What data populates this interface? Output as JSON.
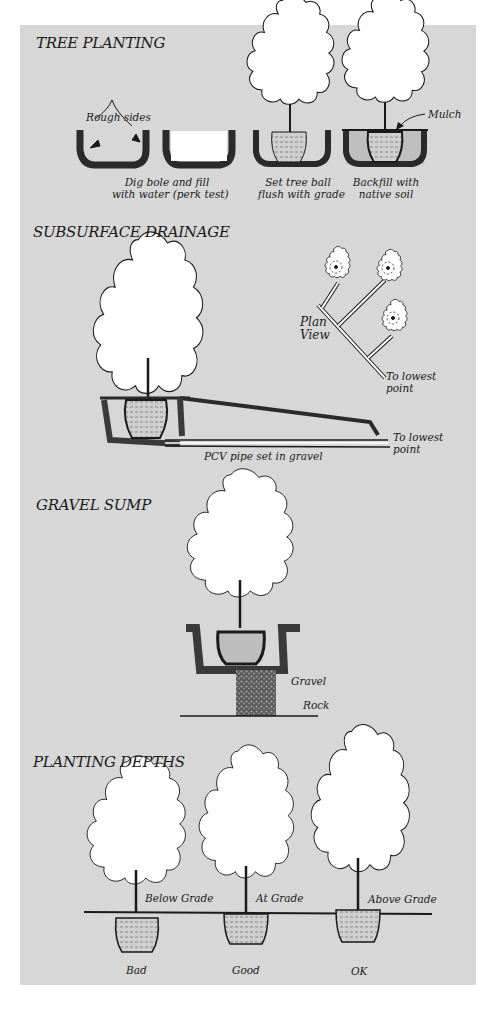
{
  "sections": {
    "tree_planting": {
      "title": "TREE PLANTING",
      "labels": {
        "rough_sides": "Rough sides",
        "mulch": "Mulch",
        "dig_line1": "Dig bole and fill",
        "dig_line2": "with water (perk test)",
        "set_line1": "Set tree ball",
        "set_line2": "flush with grade",
        "backfill_line1": "Backfill with",
        "backfill_line2": "native soil"
      }
    },
    "subsurface_drainage": {
      "title": "SUBSURFACE DRAINAGE",
      "labels": {
        "plan_line1": "Plan",
        "plan_line2": "View",
        "lowest_plan_line1": "To lowest",
        "lowest_plan_line2": "point",
        "lowest_section_line1": "To lowest",
        "lowest_section_line2": "point",
        "pipe": "PCV pipe set in gravel"
      }
    },
    "gravel_sump": {
      "title": "GRAVEL SUMP",
      "labels": {
        "gravel": "Gravel",
        "rock": "Rock"
      }
    },
    "planting_depths": {
      "title": "PLANTING DEPTHS",
      "labels": {
        "below_grade": "Below Grade",
        "at_grade": "At Grade",
        "above_grade": "Above Grade",
        "bad": "Bad",
        "good": "Good",
        "ok": "OK"
      }
    }
  },
  "colors": {
    "panel_bg": "#d7d7d7",
    "ink": "#1a1a1a",
    "canopy": "#ffffff"
  }
}
